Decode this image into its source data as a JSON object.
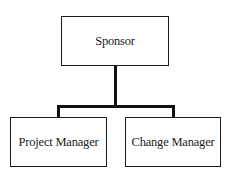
{
  "diagram": {
    "type": "org-chart",
    "root": {
      "label": "Sponsor"
    },
    "children": [
      {
        "label": "Project Manager"
      },
      {
        "label": "Change Manager"
      }
    ]
  }
}
